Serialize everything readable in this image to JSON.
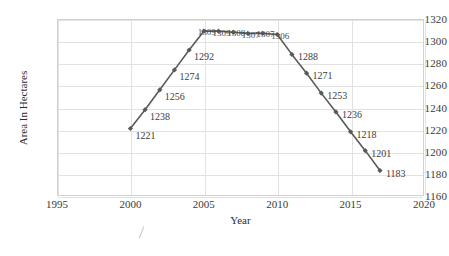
{
  "chart_data": {
    "type": "line",
    "title": "",
    "xlabel": "Year",
    "ylabel": "Area In Hectares",
    "xlim": [
      1995,
      2020
    ],
    "ylim": [
      1160,
      1320
    ],
    "xticks": [
      1995,
      2000,
      2005,
      2010,
      2015,
      2020
    ],
    "yticks": [
      1160,
      1180,
      1200,
      1220,
      1240,
      1260,
      1280,
      1300,
      1320
    ],
    "grid": true,
    "legend": "none",
    "series_color": "#595959",
    "marker": "diamond",
    "x": [
      2000,
      2001,
      2002,
      2003,
      2004,
      2005,
      2006,
      2007,
      2008,
      2009,
      2010,
      2011,
      2012,
      2013,
      2014,
      2015,
      2016,
      2017
    ],
    "values": [
      1221,
      1238,
      1256,
      1274,
      1292,
      1309,
      1309,
      1308,
      1307,
      1307,
      1306,
      1288,
      1271,
      1253,
      1236,
      1218,
      1201,
      1183
    ],
    "point_labels": [
      "1221",
      "1238",
      "1256",
      "1274",
      "1292",
      "1309",
      "1309",
      "1308",
      "1307",
      "1307",
      "1306",
      "1288",
      "1271",
      "1253",
      "1236",
      "1218",
      "1201",
      "1183"
    ],
    "dense_label_range": [
      5,
      10
    ]
  },
  "axes": {
    "y_tick_labels": [
      "1320",
      "1300",
      "1280",
      "1260",
      "1240",
      "1220",
      "1200",
      "1180",
      "1160"
    ],
    "x_tick_labels": [
      "1995",
      "2000",
      "2005",
      "2010",
      "2015",
      "2020"
    ],
    "y_title": "Area In Hectares",
    "x_title": "Year"
  }
}
